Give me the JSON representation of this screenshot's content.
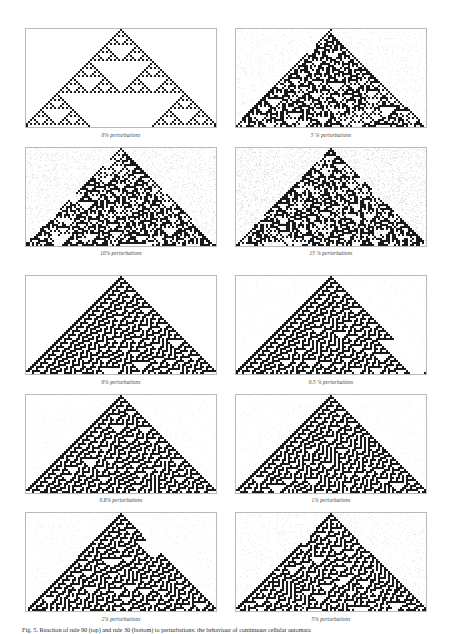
{
  "figure": {
    "caption": "Fig. 5. Reaction of rule 90 (top) and rule 30 (bottom) to perturbations: the behaviour of continuous cellular automata",
    "panel_border_color": "#b9b9b9",
    "ink_color": "#1a1a1a",
    "noise_color": "#cfcfcf"
  },
  "chart_data": {
    "type": "heatmap",
    "xlabel": "",
    "ylabel": "",
    "groups": [
      {
        "name": "rule-90",
        "rule": 90,
        "pattern": "sierpinski",
        "panels": [
          {
            "label": "0% perturbations",
            "noise": 0.0
          },
          {
            "label": "5 % perturbations",
            "noise": 0.05
          },
          {
            "label": "10% perturbations",
            "noise": 0.1
          },
          {
            "label": "15 % perturbations",
            "noise": 0.15
          }
        ]
      },
      {
        "name": "rule-30",
        "rule": 30,
        "pattern": "chaotic",
        "panels": [
          {
            "label": "0% perturbations",
            "noise": 0.0
          },
          {
            "label": "0.5 % perturbations",
            "noise": 0.005
          },
          {
            "label": "0.8% perturbations",
            "noise": 0.008
          },
          {
            "label": "1% perturbations",
            "noise": 0.01
          },
          {
            "label": "2% perturbations",
            "noise": 0.02
          },
          {
            "label": "5% perturbations",
            "noise": 0.05
          }
        ]
      }
    ]
  },
  "rows": [
    {
      "cells": [
        {
          "caption": "0% perturbations",
          "rule": 90,
          "noise": 0.0
        },
        {
          "caption": "5 % perturbations",
          "rule": 90,
          "noise": 0.05
        }
      ]
    },
    {
      "cells": [
        {
          "caption": "10% perturbations",
          "rule": 90,
          "noise": 0.1
        },
        {
          "caption": "15 % perturbations",
          "rule": 90,
          "noise": 0.15
        }
      ]
    },
    {
      "cells": [
        {
          "caption": "0% perturbations",
          "rule": 30,
          "noise": 0.0
        },
        {
          "caption": "0.5 % perturbations",
          "rule": 30,
          "noise": 0.005
        }
      ]
    },
    {
      "cells": [
        {
          "caption": "0.8% perturbations",
          "rule": 30,
          "noise": 0.008
        },
        {
          "caption": "1% perturbations",
          "rule": 30,
          "noise": 0.01
        }
      ]
    },
    {
      "cells": [
        {
          "caption": "2% perturbations",
          "rule": 30,
          "noise": 0.02
        },
        {
          "caption": "5% perturbations",
          "rule": 30,
          "noise": 0.05
        }
      ]
    }
  ]
}
